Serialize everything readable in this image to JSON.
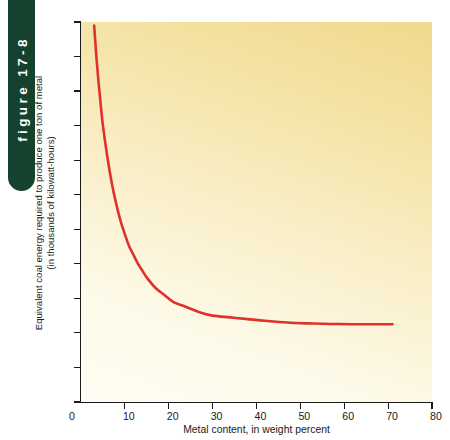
{
  "figure": {
    "tab_label": "figure 17-8",
    "tab_color": "#15422f"
  },
  "chart_data": {
    "type": "line",
    "title": "",
    "xlabel": "Metal content, in weight percent",
    "ylabel": "Equivalent coal energy required to produce one ton of metal",
    "ylabel_line2": "(in thousands of kilowatt-hours)",
    "xlim": [
      0,
      80
    ],
    "ylim": [
      0,
      220
    ],
    "xticks": [
      0,
      10,
      20,
      30,
      40,
      50,
      60,
      70,
      80
    ],
    "yticks": [
      0,
      20,
      40,
      60,
      80,
      100,
      120,
      140,
      160,
      180,
      200,
      220
    ],
    "grid": false,
    "legend": false,
    "series": [
      {
        "name": "Equivalent coal energy",
        "color": "#e0312a",
        "x": [
          3,
          3.5,
          4,
          4.5,
          5,
          6,
          7,
          8,
          9,
          10,
          11,
          12,
          13,
          14,
          15,
          17,
          19,
          21,
          24,
          27,
          30,
          34,
          38,
          42,
          47,
          52,
          57,
          62,
          66,
          71
        ],
        "y": [
          218,
          200,
          185,
          172,
          160,
          142,
          127,
          115,
          105,
          97,
          90,
          85,
          80,
          76,
          72,
          66,
          62,
          58,
          55,
          52,
          50,
          49,
          48,
          47,
          46,
          45.5,
          45.2,
          45,
          45,
          45
        ]
      }
    ]
  },
  "axis_ticks": {
    "x": [
      "0",
      "10",
      "20",
      "30",
      "40",
      "50",
      "60",
      "70",
      "80"
    ],
    "y": [
      "0",
      "20",
      "40",
      "60",
      "80",
      "100",
      "120",
      "140",
      "160",
      "180",
      "200",
      "220"
    ]
  }
}
